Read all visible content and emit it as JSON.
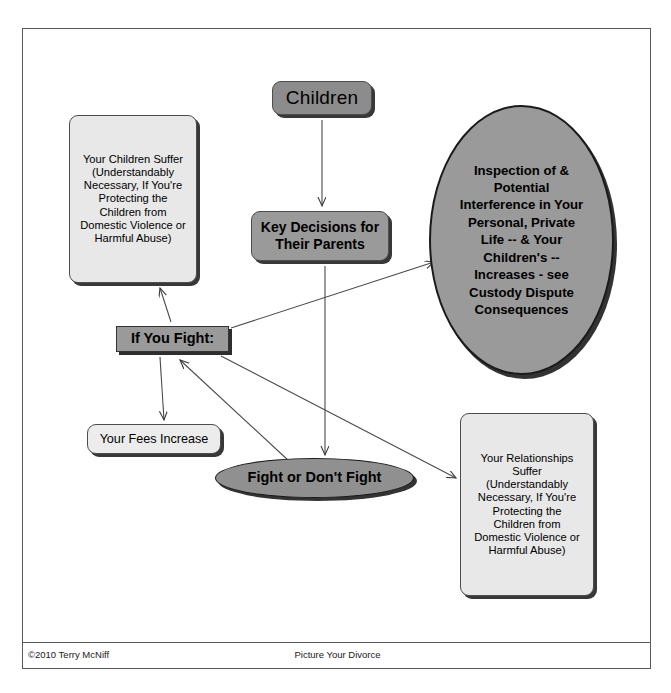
{
  "document": {
    "title": "Picture Your Divorce",
    "footer_left": "©2010 Terry McNiff",
    "footer_center": "Picture Your Divorce"
  },
  "colors": {
    "node_dark_gray": "#8c8c8c",
    "node_mid_gray": "#9a9a9a",
    "node_light_gray": "#e8e8e8",
    "frame_border": "#595959",
    "text": "#000000"
  },
  "diagram": {
    "type": "flowchart",
    "nodes": [
      {
        "id": "children",
        "label": "Children",
        "shape": "rounded-rect",
        "fill": "#8c8c8c",
        "bold": false
      },
      {
        "id": "children-suffer",
        "label": "Your Children Suffer (Understandably Necessary, If You're Protecting the Children from Domestic Violence or Harmful Abuse)",
        "lines": "Your Children Suffer\n(Understandably\nNecessary, If You're\nProtecting the\nChildren from\nDomestic Violence or\nHarmful Abuse)",
        "shape": "rounded-rect",
        "fill": "#e8e8e8",
        "bold": false
      },
      {
        "id": "key-decisions",
        "label": "Key Decisions for Their Parents",
        "lines": "Key Decisions for\nTheir Parents",
        "shape": "rounded-rect",
        "fill": "#9a9a9a",
        "bold": true
      },
      {
        "id": "inspection",
        "label": "Inspection of & Potential Interference in Your Personal, Private Life -- & Your Children's -- Increases - see Custody Dispute Consequences",
        "lines": "Inspection of &\nPotential\nInterference in Your\nPersonal, Private\nLife -- & Your\nChildren's --\nIncreases - see\nCustody Dispute\nConsequences",
        "shape": "ellipse",
        "fill": "#9a9a9a",
        "bold": true
      },
      {
        "id": "if-you-fight",
        "label": "If You Fight:",
        "shape": "rect",
        "fill": "#9a9a9a",
        "bold": true
      },
      {
        "id": "fees",
        "label": "Your Fees Increase",
        "shape": "rounded-rect",
        "fill": "#ececec",
        "bold": false
      },
      {
        "id": "fight-or-not",
        "label": "Fight or Don't Fight",
        "shape": "ellipse",
        "fill": "#909090",
        "bold": true
      },
      {
        "id": "relationships",
        "label": "Your Relationships Suffer (Understandably Necessary, If You're Protecting the Children from Domestic Violence or Harmful Abuse)",
        "lines": "Your Relationships\nSuffer\n(Understandably\nNecessary, If You're\nProtecting the\nChildren from\nDomestic Violence or\nHarmful Abuse)",
        "shape": "rounded-rect",
        "fill": "#e8e8e8",
        "bold": false
      }
    ],
    "edges": [
      {
        "from": "children",
        "to": "key-decisions",
        "style": "arrow"
      },
      {
        "from": "key-decisions",
        "to": "fight-or-not",
        "style": "arrow"
      },
      {
        "from": "if-you-fight",
        "to": "children-suffer",
        "style": "arrow"
      },
      {
        "from": "if-you-fight",
        "to": "fees",
        "style": "arrow"
      },
      {
        "from": "if-you-fight",
        "to": "inspection",
        "style": "arrow"
      },
      {
        "from": "if-you-fight",
        "to": "relationships",
        "style": "arrow"
      },
      {
        "from": "fight-or-not",
        "to": "if-you-fight",
        "style": "arrow"
      }
    ]
  }
}
